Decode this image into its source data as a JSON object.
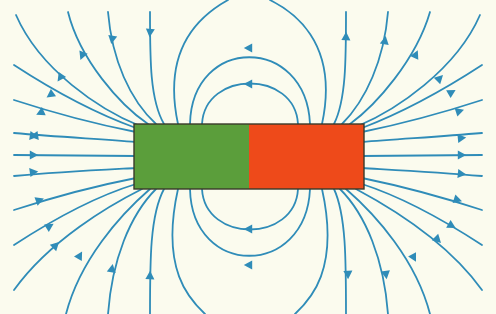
{
  "diagram": {
    "colors": {
      "background": "#fbfbee",
      "field_line": "#2f8cb8",
      "south_pole": "#5b9e3b",
      "north_pole": "#ee4a1a",
      "outline": "#3a3a2a"
    },
    "magnet": {
      "x": 134,
      "y": 124,
      "width": 230,
      "height": 65,
      "halves": [
        {
          "pole": "south",
          "color": "#5b9e3b",
          "side": "left"
        },
        {
          "pole": "north",
          "color": "#ee4a1a",
          "side": "right"
        }
      ]
    },
    "field_direction": "out of the red (right) pole, into the green (left) pole",
    "field_line_count_visible": 40
  }
}
